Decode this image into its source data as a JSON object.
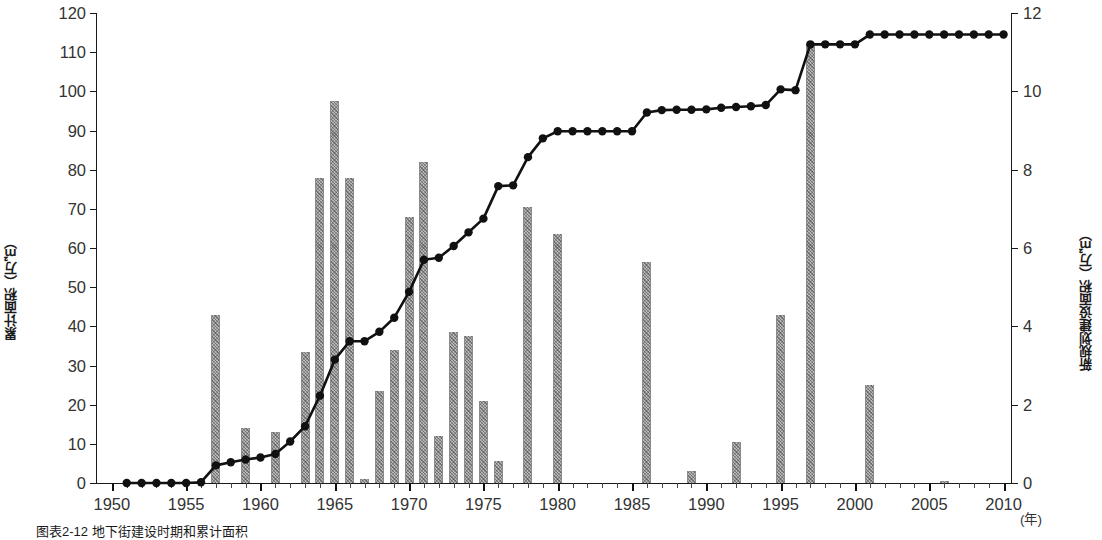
{
  "figure": {
    "caption": "图表2-12 地下街建设时期和累计面积",
    "year_unit": "(年)"
  },
  "chart_data": {
    "type": "bar",
    "title": "",
    "subtitle": "",
    "xlabel": "(年)",
    "ylabel": "累计面积（万㎡）",
    "y2label": "新规划建设面积（万㎡）",
    "xlim": [
      1949,
      2010.5
    ],
    "ylim": [
      0,
      120
    ],
    "y2lim": [
      0,
      12
    ],
    "grid": false,
    "legend_position": "none",
    "x_ticks_major": [
      1950,
      1955,
      1960,
      1965,
      1970,
      1975,
      1980,
      1985,
      1990,
      1995,
      2000,
      2005,
      2010
    ],
    "x_tick_labels": [
      "1950",
      "1955",
      "1960",
      "1965",
      "1970",
      "1975",
      "1980",
      "1985",
      "1990",
      "1995",
      "2000",
      "2005",
      "2010"
    ],
    "x_minor_tick_step": 1,
    "y_ticks": [
      0,
      10,
      20,
      30,
      40,
      50,
      60,
      70,
      80,
      90,
      100,
      110,
      120
    ],
    "y_tick_labels": [
      "0",
      "10",
      "20",
      "30",
      "40",
      "50",
      "60",
      "70",
      "80",
      "90",
      "100",
      "110",
      "120"
    ],
    "y2_ticks": [
      0,
      2,
      4,
      6,
      8,
      10,
      12
    ],
    "y2_tick_labels": [
      "0",
      "2",
      "4",
      "6",
      "8",
      "10",
      "12"
    ],
    "series": [
      {
        "name": "新规划建设面积（万㎡）",
        "type": "bar",
        "axis": "right",
        "color": "#b9b9b9",
        "x": [
          1957,
          1959,
          1961,
          1963,
          1964,
          1965,
          1966,
          1967,
          1968,
          1969,
          1970,
          1971,
          1972,
          1973,
          1974,
          1975,
          1976,
          1978,
          1980,
          1986,
          1989,
          1992,
          1995,
          1997,
          2001,
          2006
        ],
        "values": [
          4.3,
          1.4,
          1.3,
          3.35,
          7.8,
          9.75,
          7.8,
          0.1,
          2.35,
          3.4,
          6.8,
          8.2,
          1.2,
          3.85,
          3.75,
          2.1,
          0.55,
          7.05,
          6.35,
          5.65,
          0.3,
          1.05,
          4.3,
          11.2,
          2.5,
          0.05
        ]
      },
      {
        "name": "累计面积（万㎡）",
        "type": "line",
        "axis": "left",
        "color": "#111111",
        "x": [
          1951,
          1952,
          1953,
          1954,
          1955,
          1956,
          1957,
          1958,
          1959,
          1960,
          1961,
          1962,
          1963,
          1964,
          1965,
          1966,
          1967,
          1968,
          1969,
          1970,
          1971,
          1972,
          1973,
          1974,
          1975,
          1976,
          1977,
          1978,
          1979,
          1980,
          1981,
          1982,
          1983,
          1984,
          1985,
          1986,
          1987,
          1988,
          1989,
          1990,
          1991,
          1992,
          1993,
          1994,
          1995,
          1996,
          1997,
          1998,
          1999,
          2000,
          2001,
          2002,
          2003,
          2004,
          2005,
          2006,
          2007,
          2008,
          2009,
          2010
        ],
        "values": [
          0,
          0,
          0,
          0,
          0,
          0.2,
          4.5,
          5.3,
          6,
          6.5,
          7.4,
          10.6,
          14.5,
          22.3,
          31.5,
          36.2,
          36.2,
          38.6,
          42.2,
          48.8,
          57,
          57.5,
          60.5,
          64,
          67.5,
          75.8,
          76,
          83.2,
          88,
          89.8,
          89.8,
          89.8,
          89.8,
          89.8,
          89.8,
          94.6,
          95.2,
          95.3,
          95.3,
          95.4,
          95.8,
          96,
          96.2,
          96.5,
          100.5,
          100.3,
          112,
          112,
          112,
          112,
          114.5,
          114.5,
          114.5,
          114.5,
          114.5,
          114.5,
          114.5,
          114.5,
          114.5,
          114.5
        ]
      }
    ]
  }
}
